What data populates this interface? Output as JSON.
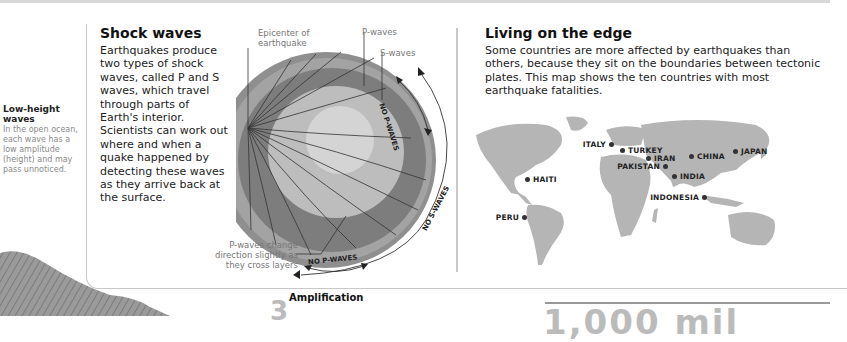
{
  "sidebar": {
    "low_height": {
      "title": "Low-height waves",
      "text": "In the open ocean, each wave has a low amplitude (height) and may pass unnoticed."
    }
  },
  "shock_waves": {
    "title": "Shock waves",
    "body": "Earthquakes produce two types of shock waves, called P and S waves, which travel through parts of Earth's interior. Scientists can work out where and when a quake happened by detecting these waves as they arrive back at the surface.",
    "diagram": {
      "labels": {
        "epicenter": "Epicenter of earthquake",
        "p_waves": "P-waves",
        "s_waves": "S-waves",
        "no_p_waves_side": "NO P-WAVES",
        "no_s_waves": "NO S-WAVES",
        "no_p_waves_bottom": "NO P-WAVES",
        "p_waves_change": "P-waves change direction slightly as they cross layers"
      }
    }
  },
  "living_on_edge": {
    "title": "Living on the edge",
    "body": "Some countries are more affected by earthquakes than others, because they sit on the boundaries between tectonic plates. This map shows the ten countries with most earthquake fatalities.",
    "countries": [
      {
        "name": "ITALY",
        "x": 145,
        "y": 30,
        "side": "left"
      },
      {
        "name": "TURKEY",
        "x": 157,
        "y": 36,
        "side": "right"
      },
      {
        "name": "IRAN",
        "x": 183,
        "y": 44,
        "side": "right"
      },
      {
        "name": "PAKISTAN",
        "x": 199,
        "y": 52,
        "side": "left"
      },
      {
        "name": "CHINA",
        "x": 226,
        "y": 42,
        "side": "right"
      },
      {
        "name": "JAPAN",
        "x": 270,
        "y": 37,
        "side": "right"
      },
      {
        "name": "INDIA",
        "x": 209,
        "y": 62,
        "side": "right"
      },
      {
        "name": "INDONESIA",
        "x": 238,
        "y": 83,
        "side": "left"
      },
      {
        "name": "HAITI",
        "x": 62,
        "y": 65,
        "side": "right"
      },
      {
        "name": "PERU",
        "x": 58,
        "y": 103,
        "side": "left"
      }
    ]
  },
  "bottom": {
    "amplification_number": "3",
    "amplification_title": "Amplification",
    "big_number": "1,000 mil"
  }
}
